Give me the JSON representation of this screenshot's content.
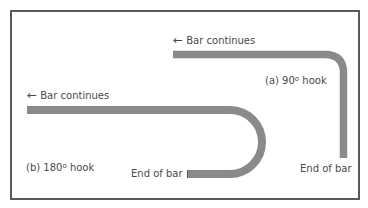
{
  "diagram": {
    "colors": {
      "bar": "#8a8a8a",
      "frame": "#5a5a5a",
      "text": "#4a4a4a",
      "background": "#ffffff"
    },
    "hook_a": {
      "caption_prefix": "(a) 90",
      "caption_degree": "o",
      "caption_suffix": " hook",
      "continues_arrow": "←",
      "continues_label": "Bar continues",
      "end_label": "End of bar"
    },
    "hook_b": {
      "caption_prefix": "(b) 180",
      "caption_degree": "o",
      "caption_suffix": " hook",
      "continues_arrow": "←",
      "continues_label": "Bar continues",
      "end_label": "End of bar"
    }
  }
}
